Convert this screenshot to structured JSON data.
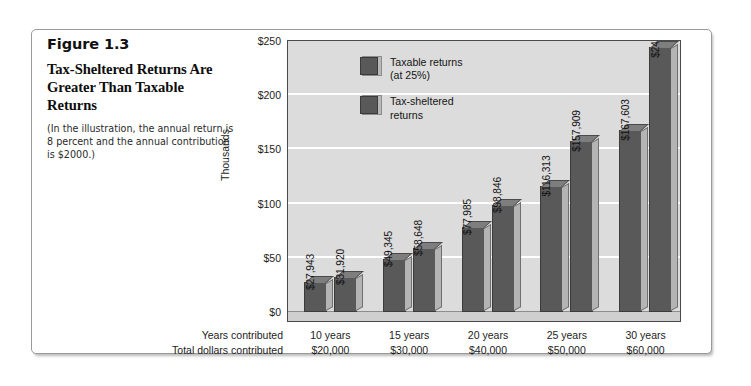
{
  "figure": {
    "number": "Figure 1.3",
    "title": "Tax-Sheltered Returns Are Greater Than Taxable Returns",
    "note": "(In the illustration, the annual return is 8 percent and the annual contribution is $2000.)"
  },
  "legend": {
    "items": [
      {
        "label": "Taxable returns\n(at 25%)",
        "color": "#595959"
      },
      {
        "label": "Tax-sheltered\nreturns",
        "color": "#595959"
      }
    ]
  },
  "axis": {
    "y_title": "Thousands",
    "y_ticks": [
      "$250",
      "$200",
      "$150",
      "$100",
      "$50",
      "$0"
    ],
    "row_titles": [
      "Years contributed",
      "Total dollars contributed"
    ]
  },
  "chart_data": {
    "type": "bar",
    "title": "Tax-Sheltered Returns Are Greater Than Taxable Returns",
    "xlabel": "",
    "ylabel": "Thousands",
    "ylim": [
      0,
      250
    ],
    "ytick_values": [
      0,
      50,
      100,
      150,
      200,
      250
    ],
    "grid": true,
    "legend_position": "top-left-inside",
    "categories": [
      "10 years",
      "15 years",
      "20 years",
      "25 years",
      "30 years"
    ],
    "secondary_categories": [
      "$20,000",
      "$30,000",
      "$40,000",
      "$50,000",
      "$60,000"
    ],
    "series": [
      {
        "name": "Taxable returns (at 25%)",
        "color": "#595959",
        "values": [
          27943,
          49345,
          77985,
          116313,
          167603
        ],
        "labels": [
          "$27,943",
          "$49,345",
          "$77,985",
          "$116,313",
          "$167,603"
        ]
      },
      {
        "name": "Tax-sheltered returns",
        "color": "#595959",
        "values": [
          31920,
          58648,
          98846,
          157909,
          244691
        ],
        "labels": [
          "$31,920",
          "$58,648",
          "$98,846",
          "$157,909",
          "$244,691"
        ]
      }
    ]
  }
}
